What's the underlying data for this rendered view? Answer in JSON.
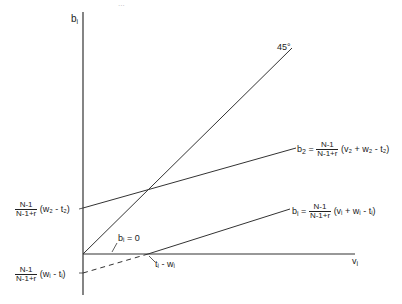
{
  "diagram": {
    "header_fragment": "...",
    "y_axis_label": "b",
    "y_axis_sub": "i",
    "x_axis_label": "v",
    "x_axis_sub": "i",
    "line_45_label": "45°",
    "b2_line": {
      "lhs": "b",
      "lhs_sub": "2",
      "eq": "=",
      "frac_num": "N-1",
      "frac_den": "N-1+r",
      "expr": "(v₂ + w₂ - t₂)"
    },
    "b1_line": {
      "lhs": "b",
      "lhs_sub": "i",
      "eq": "=",
      "frac_num": "N-1",
      "frac_den": "N-1+r",
      "expr": "(vᵢ + wᵢ - tᵢ)"
    },
    "b2_intercept": {
      "frac_num": "N-1",
      "frac_den": "N-1+r",
      "expr": "(w₂ - t₂)"
    },
    "b1_intercept": {
      "frac_num": "N-1",
      "frac_den": "N-1+r",
      "expr": "(wᵢ - tᵢ)"
    },
    "bi_zero_label": "bᵢ = 0",
    "xintercept_label": "tᵢ - wᵢ",
    "colors": {
      "line": "#333333",
      "background": "#ffffff"
    }
  }
}
